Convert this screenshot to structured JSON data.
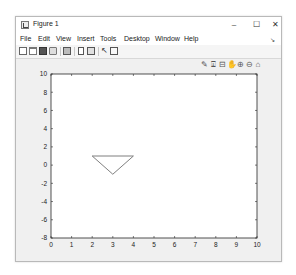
{
  "window": {
    "title": "Figure 1",
    "controls": {
      "minimize": "–",
      "maximize": "☐",
      "close": "✕"
    }
  },
  "menubar": {
    "items": [
      "File",
      "Edit",
      "View",
      "Insert",
      "Tools",
      "Desktop",
      "Window",
      "Help"
    ],
    "overflow_arrow": "↘"
  },
  "toolbar": {
    "icons": [
      "new-figure-icon",
      "open-file-icon",
      "save-icon",
      "print-icon",
      "link-plot-icon",
      "insert-colorbar-icon",
      "insert-legend-icon",
      "edit-plot-icon",
      "property-inspector-icon"
    ]
  },
  "axes_toolbar": {
    "icons": [
      {
        "name": "brush-icon",
        "glyph": "✎"
      },
      {
        "name": "data-tips-icon",
        "glyph": "⍗"
      },
      {
        "name": "restore-rect-icon",
        "glyph": "⊟"
      },
      {
        "name": "pan-icon",
        "glyph": "✋"
      },
      {
        "name": "zoom-in-icon",
        "glyph": "⊕"
      },
      {
        "name": "zoom-out-icon",
        "glyph": "⊖"
      },
      {
        "name": "home-icon",
        "glyph": "⌂"
      }
    ]
  },
  "chart_data": {
    "type": "line",
    "title": "",
    "xlabel": "",
    "ylabel": "",
    "xlim": [
      0,
      10
    ],
    "ylim": [
      -8,
      10
    ],
    "xticks": [
      0,
      1,
      2,
      3,
      4,
      5,
      6,
      7,
      8,
      9,
      10
    ],
    "yticks": [
      -8,
      -6,
      -4,
      -2,
      0,
      2,
      4,
      6,
      8,
      10
    ],
    "grid": false,
    "legend": null,
    "series": [
      {
        "name": "triangle",
        "x": [
          2,
          4,
          3,
          2
        ],
        "y": [
          1,
          1,
          -1,
          1
        ],
        "color": "#707070"
      }
    ]
  }
}
